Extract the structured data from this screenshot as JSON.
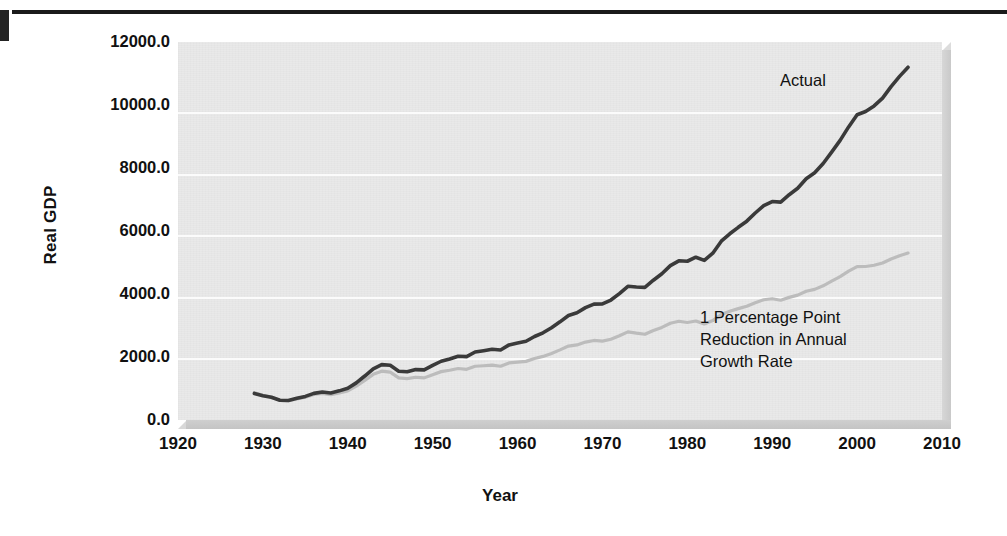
{
  "figure": {
    "y_axis_title": "Real GDP",
    "x_axis_title": "Year"
  },
  "annotations": {
    "actual": "Actual",
    "reduced": "1 Percentage Point\nReduction in Annual\nGrowth Rate"
  },
  "chart_data": {
    "type": "line",
    "title": "",
    "xlabel": "Year",
    "ylabel": "Real GDP",
    "xlim": [
      1920,
      2010
    ],
    "ylim": [
      0,
      12000
    ],
    "xticks": [
      "1920",
      "1930",
      "1940",
      "1950",
      "1960",
      "1970",
      "1980",
      "1990",
      "2000",
      "2010"
    ],
    "yticks": [
      "0.0",
      "2000.0",
      "4000.0",
      "6000.0",
      "8000.0",
      "10000.0",
      "12000.0"
    ],
    "grid": "horizontal",
    "legend": "annotated-inline",
    "colors": {
      "actual": "#3a3a3a",
      "reduced": "#b9b9b9",
      "panel": "#e9e9e9",
      "gridline": "#fbfbfb"
    },
    "series": [
      {
        "name": "Actual",
        "color": "#3a3a3a",
        "x": [
          1929,
          1930,
          1931,
          1932,
          1933,
          1934,
          1935,
          1936,
          1937,
          1938,
          1939,
          1940,
          1941,
          1942,
          1943,
          1944,
          1945,
          1946,
          1947,
          1948,
          1949,
          1950,
          1951,
          1952,
          1953,
          1954,
          1955,
          1956,
          1957,
          1958,
          1959,
          1960,
          1961,
          1962,
          1963,
          1964,
          1965,
          1966,
          1967,
          1968,
          1969,
          1970,
          1971,
          1972,
          1973,
          1974,
          1975,
          1976,
          1977,
          1978,
          1979,
          1980,
          1981,
          1982,
          1983,
          1984,
          1985,
          1986,
          1987,
          1988,
          1989,
          1990,
          1991,
          1992,
          1993,
          1994,
          1995,
          1996,
          1997,
          1998,
          1999,
          2000,
          2001,
          2002,
          2003,
          2004,
          2005,
          2006
        ],
        "values": [
          977,
          893,
          836,
          728,
          718,
          796,
          867,
          979,
          1030,
          995,
          1072,
          1166,
          1366,
          1618,
          1883,
          2035,
          2012,
          1792,
          1776,
          1854,
          1844,
          2006,
          2161,
          2244,
          2347,
          2332,
          2500,
          2549,
          2601,
          2577,
          2762,
          2830,
          2897,
          3072,
          3207,
          3392,
          3610,
          3845,
          3942,
          4133,
          4262,
          4270,
          4413,
          4648,
          4917,
          4890,
          4879,
          5141,
          5378,
          5678,
          5855,
          5839,
          5987,
          5871,
          6136,
          6577,
          6849,
          7087,
          7313,
          7614,
          7886,
          8034,
          8015,
          8287,
          8523,
          8871,
          9094,
          9434,
          9854,
          10284,
          10780,
          11226,
          11347,
          11553,
          11841,
          12264,
          12638,
          12976
        ],
        "note": "scaled in chart units; plotted peak ≈ 11200 at 2006"
      },
      {
        "name": "1 Percentage Point Reduction in Annual Growth Rate",
        "color": "#b9b9b9",
        "x": [
          1929,
          1930,
          1931,
          1932,
          1933,
          1934,
          1935,
          1936,
          1937,
          1938,
          1939,
          1940,
          1941,
          1942,
          1943,
          1944,
          1945,
          1946,
          1947,
          1948,
          1949,
          1950,
          1951,
          1952,
          1953,
          1954,
          1955,
          1956,
          1957,
          1958,
          1959,
          1960,
          1961,
          1962,
          1963,
          1964,
          1965,
          1966,
          1967,
          1968,
          1969,
          1970,
          1971,
          1972,
          1973,
          1974,
          1975,
          1976,
          1977,
          1978,
          1979,
          1980,
          1981,
          1982,
          1983,
          1984,
          1985,
          1986,
          1987,
          1988,
          1989,
          1990,
          1991,
          1992,
          1993,
          1994,
          1995,
          1996,
          1997,
          1998,
          1999,
          2000,
          2001,
          2002,
          2003,
          2004,
          2005,
          2006
        ],
        "values": [
          977,
          884,
          819,
          706,
          689,
          756,
          816,
          912,
          950,
          908,
          969,
          1043,
          1210,
          1419,
          1635,
          1749,
          1712,
          1510,
          1481,
          1531,
          1508,
          1624,
          1732,
          1780,
          1843,
          1813,
          1924,
          1942,
          1962,
          1925,
          2042,
          2071,
          2099,
          2203,
          2276,
          2383,
          2511,
          2648,
          2688,
          2790,
          2848,
          2825,
          2891,
          3014,
          3156,
          3108,
          3069,
          3201,
          3315,
          3464,
          3536,
          3491,
          3544,
          3441,
          3559,
          3776,
          3893,
          3988,
          4073,
          4199,
          4306,
          4342,
          4288,
          4390,
          4471,
          4608,
          4677,
          4804,
          4969,
          5133,
          5327,
          5492,
          5495,
          5539,
          5621,
          5766,
          5883,
          5977
        ],
        "note": "counterfactual path, ends ≈ 5300 in chart units"
      }
    ]
  }
}
